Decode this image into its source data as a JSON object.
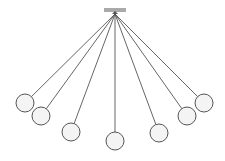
{
  "diagram": {
    "type": "pendulum-fan",
    "colors": {
      "background": "#ffffff",
      "line": "#555555",
      "bob_stroke": "#555555",
      "bob_fill": "#f4f4f4",
      "bar": "#555555"
    },
    "pivot": {
      "x": 115,
      "y": 14
    },
    "support_bar": {
      "x1": 104,
      "x2": 126,
      "y1": 9,
      "y2": 11
    },
    "bob_radius": 9,
    "bobs": [
      {
        "x": 25,
        "y": 103
      },
      {
        "x": 41,
        "y": 116
      },
      {
        "x": 71,
        "y": 132
      },
      {
        "x": 115,
        "y": 141
      },
      {
        "x": 159,
        "y": 133
      },
      {
        "x": 187,
        "y": 116
      },
      {
        "x": 204,
        "y": 103
      }
    ]
  }
}
